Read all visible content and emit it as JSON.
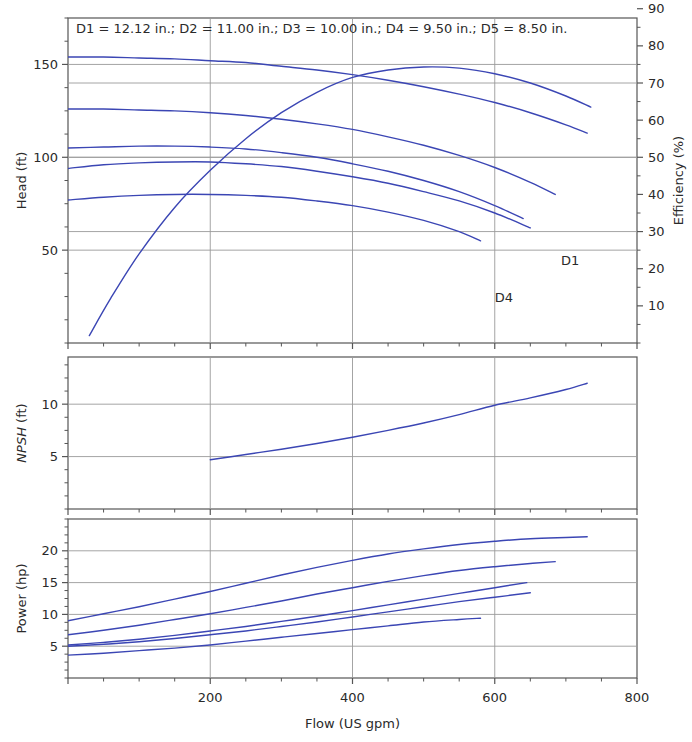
{
  "figure": {
    "title": "D1 = 12.12 in.; D2 = 11.00 in.; D3 = 10.00 in.; D4 = 9.50 in.; D5 = 8.50 in.",
    "background_color": "#ffffff",
    "curve_color": "#3b46b4",
    "grid_color": "#9a9a9a",
    "axis_color": "#555555",
    "xlabel": "Flow (US gpm)",
    "impellers": [
      {
        "name": "D1",
        "diameter_in": 12.12
      },
      {
        "name": "D2",
        "diameter_in": 11.0
      },
      {
        "name": "D3",
        "diameter_in": 10.0
      },
      {
        "name": "D4",
        "diameter_in": 9.5
      },
      {
        "name": "D5",
        "diameter_in": 8.5
      }
    ],
    "annotations": [
      {
        "text": "D1",
        "x": 693,
        "panel": "head",
        "y": 42
      },
      {
        "text": "D4",
        "x": 600,
        "panel": "head",
        "y": 22
      }
    ]
  },
  "chart_data": [
    {
      "id": "head-efficiency-panel",
      "type": "line",
      "title": "D1 = 12.12 in.; D2 = 11.00 in.; D3 = 10.00 in.; D4 = 9.50 in.; D5 = 8.50 in.",
      "xlabel": "",
      "ylabel": "Head (ft)",
      "y2label": "Efficiency (%)",
      "xlim": [
        0,
        800
      ],
      "ylim": [
        0,
        175
      ],
      "y2lim": [
        0,
        87.5
      ],
      "xticks": [
        0,
        200,
        400,
        600,
        800
      ],
      "xticklabels": [
        "",
        "200",
        "400",
        "600",
        "800"
      ],
      "xminorstep": 50,
      "yticks": [
        50,
        100,
        150
      ],
      "yticklabels": [
        "50",
        "100",
        "150"
      ],
      "yminorstep": 12.5,
      "y2ticks": [
        10,
        20,
        30,
        40,
        50,
        60,
        70,
        80,
        90
      ],
      "y2ticklabels": [
        "10",
        "20",
        "30",
        "40",
        "50",
        "60",
        "70",
        "80",
        "90"
      ],
      "y2minorstep": 5,
      "grid": true,
      "legend": "none",
      "series": [
        {
          "name": "D1 head",
          "axis": "left",
          "x": [
            0,
            50,
            100,
            150,
            200,
            250,
            300,
            350,
            400,
            450,
            500,
            550,
            600,
            650,
            700,
            730
          ],
          "values": [
            154,
            154,
            153.5,
            153,
            152,
            151,
            149,
            147,
            144.5,
            141.5,
            138,
            134,
            129.5,
            124,
            117.5,
            113
          ]
        },
        {
          "name": "D2 head",
          "axis": "left",
          "x": [
            0,
            50,
            100,
            150,
            200,
            250,
            300,
            350,
            400,
            450,
            500,
            550,
            600,
            650,
            685
          ],
          "values": [
            126,
            126,
            125.5,
            125,
            124,
            122.5,
            120.5,
            118,
            115,
            111,
            106.5,
            101,
            94.5,
            86.5,
            80
          ]
        },
        {
          "name": "D3 head",
          "axis": "left",
          "x": [
            0,
            50,
            100,
            150,
            200,
            250,
            300,
            350,
            400,
            450,
            500,
            550,
            600,
            640
          ],
          "values": [
            105,
            105.5,
            106,
            106,
            105.5,
            104.5,
            102.5,
            100,
            96.5,
            92.5,
            87.5,
            81.5,
            74,
            67
          ]
        },
        {
          "name": "D4 head",
          "axis": "left",
          "x": [
            0,
            50,
            100,
            150,
            200,
            250,
            300,
            350,
            400,
            450,
            500,
            550,
            600,
            650
          ],
          "values": [
            94,
            96,
            97,
            97.5,
            97.5,
            96.5,
            95,
            92.5,
            89.5,
            86,
            81.5,
            76.5,
            70,
            62
          ]
        },
        {
          "name": "D5 head",
          "axis": "left",
          "x": [
            0,
            50,
            100,
            150,
            200,
            250,
            300,
            350,
            400,
            450,
            500,
            550,
            580
          ],
          "values": [
            77,
            78.5,
            79.5,
            80,
            80,
            79.5,
            78.5,
            76.5,
            74,
            70.5,
            66,
            60,
            55
          ]
        },
        {
          "name": "Efficiency",
          "axis": "right",
          "x": [
            30,
            60,
            100,
            150,
            200,
            250,
            300,
            350,
            400,
            450,
            500,
            550,
            600,
            650,
            700,
            735
          ],
          "values": [
            2,
            12,
            24,
            36.5,
            46.5,
            55,
            62,
            67.5,
            71.5,
            73.5,
            74.3,
            74,
            72.5,
            70,
            66.5,
            63.5
          ]
        }
      ]
    },
    {
      "id": "npsh-panel",
      "type": "line",
      "xlabel": "",
      "ylabel": "NPSH (ft)",
      "xlim": [
        0,
        800
      ],
      "ylim": [
        0,
        14.5
      ],
      "xticks": [
        0,
        200,
        400,
        600,
        800
      ],
      "xticklabels": [
        "",
        "",
        "",
        "",
        ""
      ],
      "xminorstep": 50,
      "yticks": [
        5,
        10
      ],
      "yticklabels": [
        "5",
        "10"
      ],
      "yminorstep": 1.25,
      "grid": true,
      "legend": "none",
      "series": [
        {
          "name": "NPSH required",
          "axis": "left",
          "x": [
            200,
            250,
            300,
            350,
            400,
            450,
            500,
            550,
            600,
            650,
            700,
            730
          ],
          "values": [
            4.7,
            5.2,
            5.7,
            6.25,
            6.85,
            7.5,
            8.2,
            9.0,
            9.9,
            10.6,
            11.4,
            12.0
          ]
        }
      ]
    },
    {
      "id": "power-panel",
      "type": "line",
      "xlabel": "Flow (US gpm)",
      "ylabel": "Power (hp)",
      "xlim": [
        0,
        800
      ],
      "ylim": [
        0,
        25
      ],
      "xticks": [
        0,
        200,
        400,
        600,
        800
      ],
      "xticklabels": [
        "",
        "200",
        "400",
        "600",
        "800"
      ],
      "xminorstep": 50,
      "yticks": [
        5,
        10,
        15,
        20
      ],
      "yticklabels": [
        "5",
        "10",
        "15",
        "20"
      ],
      "yminorstep": 1.25,
      "grid": true,
      "legend": "none",
      "series": [
        {
          "name": "D1 power",
          "axis": "left",
          "x": [
            0,
            50,
            100,
            150,
            200,
            250,
            300,
            350,
            400,
            450,
            500,
            550,
            600,
            650,
            700,
            730
          ],
          "values": [
            9.0,
            10.1,
            11.2,
            12.4,
            13.6,
            14.9,
            16.2,
            17.4,
            18.5,
            19.5,
            20.3,
            21.0,
            21.5,
            21.9,
            22.1,
            22.2
          ]
        },
        {
          "name": "D2 power",
          "axis": "left",
          "x": [
            0,
            50,
            100,
            150,
            200,
            250,
            300,
            350,
            400,
            450,
            500,
            550,
            600,
            650,
            685
          ],
          "values": [
            6.8,
            7.5,
            8.3,
            9.2,
            10.1,
            11.1,
            12.1,
            13.2,
            14.2,
            15.2,
            16.1,
            16.9,
            17.5,
            18.0,
            18.3
          ]
        },
        {
          "name": "D3 power",
          "axis": "left",
          "x": [
            0,
            50,
            100,
            150,
            200,
            250,
            300,
            350,
            400,
            450,
            500,
            550,
            600,
            645
          ],
          "values": [
            5.2,
            5.6,
            6.1,
            6.7,
            7.4,
            8.1,
            8.9,
            9.7,
            10.6,
            11.5,
            12.4,
            13.3,
            14.2,
            15.0
          ]
        },
        {
          "name": "D4 power",
          "axis": "left",
          "x": [
            0,
            50,
            100,
            150,
            200,
            250,
            300,
            350,
            400,
            450,
            500,
            550,
            600,
            650
          ],
          "values": [
            5.0,
            5.3,
            5.7,
            6.2,
            6.8,
            7.4,
            8.1,
            8.8,
            9.6,
            10.4,
            11.2,
            12.0,
            12.7,
            13.4
          ]
        },
        {
          "name": "D5 power",
          "axis": "left",
          "x": [
            0,
            50,
            100,
            150,
            200,
            250,
            300,
            350,
            400,
            450,
            500,
            550,
            580
          ],
          "values": [
            3.6,
            3.9,
            4.3,
            4.7,
            5.2,
            5.8,
            6.4,
            7.0,
            7.6,
            8.2,
            8.8,
            9.2,
            9.4
          ]
        }
      ]
    }
  ]
}
